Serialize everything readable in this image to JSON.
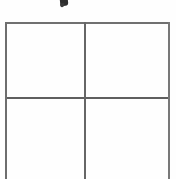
{
  "document": {
    "type": "scanned-table",
    "description": "Blank 2-by-2 grid table on white paper, bottom edge cropped",
    "background_color": "#fefefe",
    "line_color": "#6b6b6b"
  },
  "artifacts": {
    "ink_mark": {
      "name": "ink-mark",
      "label": "",
      "color": "#1c1c1c"
    }
  },
  "table": {
    "rows": 2,
    "columns": 2,
    "cells": [
      {
        "id": "r1c1",
        "text": ""
      },
      {
        "id": "r1c2",
        "text": ""
      },
      {
        "id": "r2c1",
        "text": ""
      },
      {
        "id": "r2c2",
        "text": ""
      }
    ],
    "borders": {
      "top": "#707070",
      "left": "#6e6e6e",
      "right": "#787878",
      "vertical_divider": "#666666",
      "horizontal_divider": "#5f5f5f"
    }
  }
}
